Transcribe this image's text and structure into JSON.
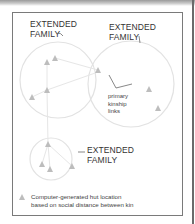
{
  "diagram": {
    "labels": {
      "family_left": [
        "EXTENDED",
        "FAMILY"
      ],
      "family_right": [
        "EXTENDED",
        "FAMILY"
      ],
      "family_bottom": [
        "EXTENDED",
        "FAMILY"
      ],
      "kinship_links": [
        "primary",
        "kinship",
        "links"
      ]
    },
    "legend": {
      "line1": "Computer-generated hut location",
      "line2": "based on social distance between kin"
    },
    "colors": {
      "circle": "#e2e2e2",
      "hut": "#bdbdbd",
      "link": "#e6e6e6",
      "leader": "#555555",
      "frame": "#7a7a7a"
    },
    "circles": [
      {
        "name": "left-family-circle",
        "cx": 58,
        "cy": 80,
        "r": 38
      },
      {
        "name": "right-family-circle",
        "cx": 131,
        "cy": 84,
        "r": 43
      },
      {
        "name": "bottom-family-circle",
        "cx": 51,
        "cy": 159,
        "r": 21
      }
    ],
    "huts": [
      {
        "x": 47,
        "y": 62
      },
      {
        "x": 55,
        "y": 58
      },
      {
        "x": 47,
        "y": 90
      },
      {
        "x": 32,
        "y": 97
      },
      {
        "x": 98,
        "y": 70
      },
      {
        "x": 149,
        "y": 89
      },
      {
        "x": 158,
        "y": 108
      },
      {
        "x": 48,
        "y": 144
      },
      {
        "x": 42,
        "y": 164
      },
      {
        "x": 50,
        "y": 169
      },
      {
        "x": 72,
        "y": 166
      }
    ]
  }
}
